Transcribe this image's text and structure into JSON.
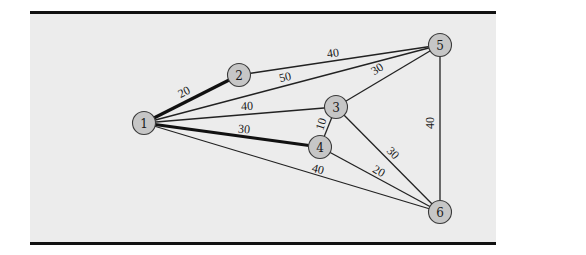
{
  "diagram": {
    "type": "weighted-network",
    "colors": {
      "page_background": "#ffffff",
      "panel_background": "#ececec",
      "rule": "#111111",
      "node_fill": "#c6c6c6",
      "node_stroke": "#3a3a3a",
      "edge": "#222222"
    },
    "nodes": [
      {
        "id": "1",
        "label": "1",
        "x": 144,
        "y": 123
      },
      {
        "id": "2",
        "label": "2",
        "x": 239,
        "y": 75
      },
      {
        "id": "3",
        "label": "3",
        "x": 336,
        "y": 107
      },
      {
        "id": "4",
        "label": "4",
        "x": 320,
        "y": 147
      },
      {
        "id": "5",
        "label": "5",
        "x": 440,
        "y": 45
      },
      {
        "id": "6",
        "label": "6",
        "x": 440,
        "y": 212
      }
    ],
    "edges": [
      {
        "from": "1",
        "to": "2",
        "weight": "20",
        "bold": true,
        "lx": 184,
        "ly": 92,
        "rot": -27
      },
      {
        "from": "2",
        "to": "5",
        "weight": "40",
        "bold": false,
        "lx": 333,
        "ly": 53,
        "rot": -8
      },
      {
        "from": "1",
        "to": "5",
        "weight": "50",
        "bold": false,
        "lx": 285,
        "ly": 77,
        "rot": -14
      },
      {
        "from": "1",
        "to": "3",
        "weight": "40",
        "bold": false,
        "lx": 247,
        "ly": 106,
        "rot": -3
      },
      {
        "from": "3",
        "to": "5",
        "weight": "30",
        "bold": false,
        "lx": 377,
        "ly": 69,
        "rot": -33
      },
      {
        "from": "1",
        "to": "4",
        "weight": "30",
        "bold": true,
        "lx": 244,
        "ly": 129,
        "rot": 5
      },
      {
        "from": "3",
        "to": "4",
        "weight": "10",
        "bold": false,
        "lx": 321,
        "ly": 124,
        "rot": -72
      },
      {
        "from": "1",
        "to": "6",
        "weight": "40",
        "bold": false,
        "lx": 318,
        "ly": 169,
        "rot": 14
      },
      {
        "from": "3",
        "to": "6",
        "weight": "30",
        "bold": false,
        "lx": 393,
        "ly": 153,
        "rot": 45
      },
      {
        "from": "4",
        "to": "6",
        "weight": "20",
        "bold": false,
        "lx": 379,
        "ly": 171,
        "rot": 30
      },
      {
        "from": "5",
        "to": "6",
        "weight": "40",
        "bold": false,
        "lx": 430,
        "ly": 123,
        "rot": -90
      }
    ]
  }
}
